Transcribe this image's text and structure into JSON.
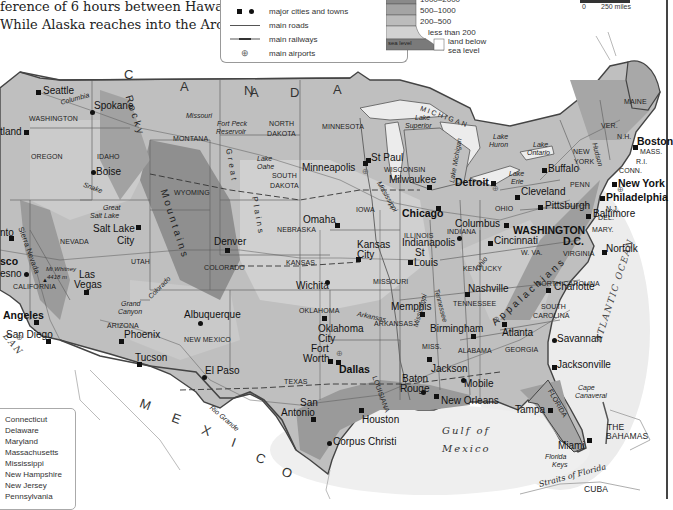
{
  "intro_text": {
    "line1": "ference of 6 hours between Hawaii and",
    "line2": "While Alaska reaches into the Arctic"
  },
  "legend": {
    "items": [
      {
        "symbol": "square-and-circle",
        "label": "major cities and towns"
      },
      {
        "symbol": "line",
        "label": "main roads"
      },
      {
        "symbol": "railway-line",
        "label": "main railways"
      },
      {
        "symbol": "airport-circle-plus",
        "label": "main airports"
      }
    ],
    "elevation": {
      "bands": [
        "1000–2000",
        "500–1000",
        "200–500",
        "less than 200"
      ],
      "sea_level_label": "sea level",
      "below_sea_label_1": "land below",
      "below_sea_label_2": "sea level",
      "colors": [
        "#8a8a8a",
        "#a4a4a4",
        "#bcbcbc",
        "#d2d2d2",
        "#7a7a7a"
      ]
    }
  },
  "scale": {
    "start": "0",
    "end": "250 miles"
  },
  "countries": {
    "canada": [
      "C",
      "A",
      "N",
      "A",
      "D",
      "A"
    ],
    "mexico": [
      "M",
      "E",
      "X",
      "I",
      "C",
      "O"
    ],
    "bahamas_1": "THE",
    "bahamas_2": "BAHAMAS",
    "cuba": "CUBA"
  },
  "oceans": {
    "atlantic": "ATLANTIC OCEAN",
    "pacific_fragment": "EAN",
    "gulf_1": "Gulf of",
    "gulf_2": "Mexico",
    "straits": "Straits of Florida"
  },
  "mountains": {
    "rocky_1": "Rocky",
    "rocky_2": "Mountains",
    "appalachians": "Appalachians",
    "sierra": "Sierra Nevada",
    "great_plains_1": "Great",
    "great_plains_2": "Plains",
    "mt_whitney_1": "Mt Whitney",
    "mt_whitney_2": "4418 m"
  },
  "states": {
    "washington": "WASHINGTON",
    "oregon": "OREGON",
    "idaho": "IDAHO",
    "montana": "MONTANA",
    "wyoming": "WYOMING",
    "nevada": "NEVADA",
    "utah": "UTAH",
    "california": "CALIFORNIA",
    "arizona": "ARIZONA",
    "colorado": "COLORADO",
    "new_mexico": "NEW MEXICO",
    "north_dakota_1": "NORTH",
    "north_dakota_2": "DAKOTA",
    "south_dakota_1": "SOUTH",
    "south_dakota_2": "DAKOTA",
    "nebraska": "NEBRASKA",
    "kansas": "KANSAS",
    "oklahoma": "OKLAHOMA",
    "texas": "TEXAS",
    "minnesota": "MINNESOTA",
    "iowa": "IOWA",
    "missouri": "MISSOURI",
    "arkansas": "ARKANSAS",
    "louisiana": "LOUISIANA",
    "wisconsin": "WISCONSIN",
    "illinois": "ILLINOIS",
    "michigan": "MICHIGAN",
    "indiana": "INDIANA",
    "ohio": "OHIO",
    "kentucky": "KENTUCKY",
    "tennessee": "TENNESSEE",
    "miss": "MISS.",
    "alabama": "ALABAMA",
    "georgia": "GEORGIA",
    "florida": "FLORIDA",
    "south_carolina_1": "SOUTH",
    "south_carolina_2": "CAROLINA",
    "north_carolina": "NORTH CAROLINA",
    "virginia": "VIRGINIA",
    "w_va": "W. VA.",
    "penn": "PENN",
    "new_york_1": "NEW",
    "new_york_2": "YORK",
    "ver": "VER.",
    "nh": "N.H.",
    "maine": "MAINE",
    "mass": "MASS.",
    "ri": "R.I.",
    "conn": "CONN.",
    "nj": "N.J.",
    "del": "DEL.",
    "mary": "MARY."
  },
  "water_features": {
    "columbia": "Columbia",
    "snake": "Snake",
    "missouri": "Missouri",
    "fort_peck_1": "Fort Peck",
    "fort_peck_2": "Reservoir",
    "lake_oahe_1": "Lake",
    "lake_oahe_2": "Oahe",
    "great_salt_lake_1": "Great",
    "great_salt_lake_2": "Salt Lake",
    "colorado": "Colorado",
    "grand_canyon_1": "Grand",
    "grand_canyon_2": "Canyon",
    "rio_grande": "Rio Grande",
    "arkansas": "Arkansas",
    "mississippi": "Mississippi",
    "tennessee": "Tennessee",
    "ohio": "Ohio",
    "hudson": "Hudson",
    "lake_superior_1": "Lake",
    "lake_superior_2": "Superior",
    "lake_michigan": "Lake Michigan",
    "lake_huron_1": "Lake",
    "lake_huron_2": "Huron",
    "lake_ontario_1": "Lake",
    "lake_ontario_2": "Ontario",
    "lake_erie_1": "Lake",
    "lake_erie_2": "Erie",
    "cape_canaveral_1": "Cape",
    "cape_canaveral_2": "Canaveral",
    "florida_keys_1": "Florida",
    "florida_keys_2": "Keys"
  },
  "cities": {
    "seattle": "Seattle",
    "spokane": "Spokane",
    "portland": "tland",
    "boise": "Boise",
    "salt_lake_1": "Salt Lake",
    "salt_lake_2": "City",
    "sacramento": "nto",
    "san_francisco": "sco",
    "fresno": "esno",
    "las_vegas_1": "Las",
    "las_vegas_2": "Vegas",
    "los_angeles": "Angeles",
    "san_diego": "San Diego",
    "phoenix": "Phoenix",
    "tucson": "Tucson",
    "albuquerque": "Albuquerque",
    "el_paso": "El Paso",
    "denver": "Denver",
    "minneapolis": "Minneapolis",
    "st_paul": "St Paul",
    "omaha": "Omaha",
    "kansas_city_1": "Kansas",
    "kansas_city_2": "City",
    "wichita": "Wichita",
    "oklahoma_city_1": "Oklahoma",
    "oklahoma_city_2": "City",
    "fort_worth_1": "Fort",
    "fort_worth_2": "Worth",
    "dallas": "Dallas",
    "san_antonio_1": "San",
    "san_antonio_2": "Antonio",
    "houston": "Houston",
    "corpus_christi": "Corpus Christi",
    "milwaukee": "Milwaukee",
    "chicago": "Chicago",
    "st_louis_1": "St",
    "st_louis_2": "Louis",
    "indianapolis": "Indianapolis",
    "memphis": "Memphis",
    "birmingham": "Birmingham",
    "jackson": "Jackson",
    "baton_rouge_1": "Baton",
    "baton_rouge_2": "Rouge",
    "new_orleans": "New Orleans",
    "mobile": "Mobile",
    "nashville": "Nashville",
    "atlanta": "Atlanta",
    "detroit": "Detroit",
    "cleveland": "Cleveland",
    "columbus": "Columbus",
    "cincinnati": "Cincinnati",
    "pittsburgh": "Pittsburgh",
    "buffalo": "Buffalo",
    "washington_1": "WASHINGTON",
    "washington_2": "D.C.",
    "baltimore": "Baltimore",
    "philadelphia": "Philadelphia",
    "new_york": "New York",
    "boston": "Boston",
    "norfolk": "Norfolk",
    "charlotte": "Charlotte",
    "savannah": "Savannah",
    "jacksonville": "Jacksonville",
    "tampa": "Tampa",
    "miami": "Miami"
  },
  "small_states_key": [
    "Connecticut",
    "Delaware",
    "Maryland",
    "Massachusetts",
    "Mississippi",
    "New Hampshire",
    "New Jersey",
    "Pennsylvania"
  ]
}
